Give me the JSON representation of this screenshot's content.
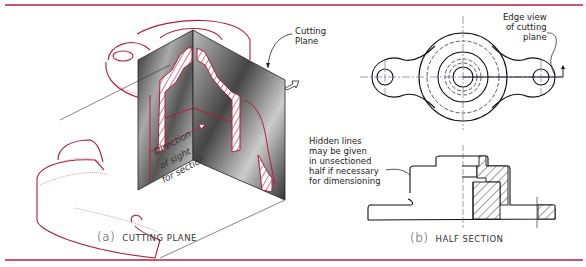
{
  "figure": {
    "panel_a": {
      "caption_letter": "(a)",
      "caption_text": "CUTTING PLANE",
      "callouts": {
        "cutting_plane_1": "Cutting",
        "cutting_plane_2": "Plane",
        "direction_1": "Direction",
        "direction_2": "of sight",
        "direction_3": "for section"
      }
    },
    "panel_b": {
      "caption_letter": "(b)",
      "caption_text": "HALF SECTION",
      "callouts": {
        "edge_view_1": "Edge view",
        "edge_view_2": "of cutting",
        "edge_view_3": "plane",
        "hidden_1": "Hidden lines",
        "hidden_2": "may be given",
        "hidden_3": "in unsectioned",
        "hidden_4": "half if necessary",
        "hidden_5": "for dimensioning"
      }
    },
    "colors": {
      "rule": "#c9566e",
      "object_outline": "#b01e3c",
      "line_black": "#111111",
      "centerline": "#6b4fa0"
    }
  }
}
